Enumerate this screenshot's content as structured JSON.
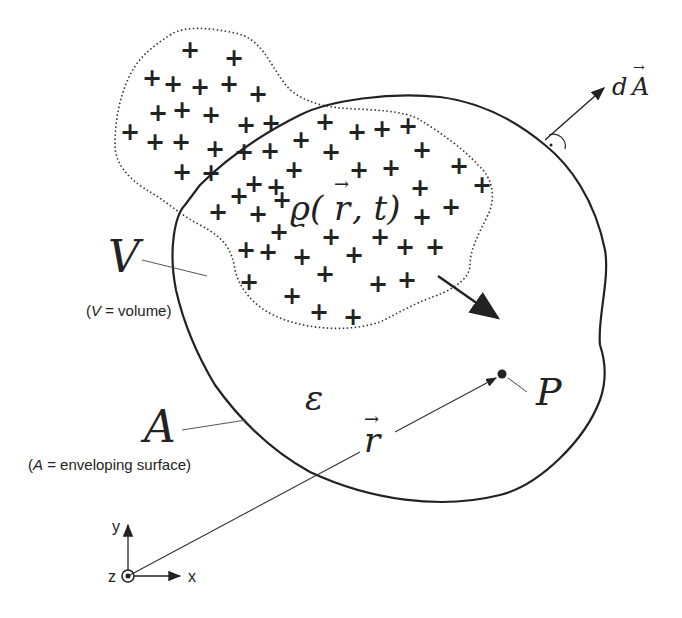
{
  "figure": {
    "density_label": "ϱ(r⃗, t)",
    "density_rho": "ϱ(",
    "density_r": "r",
    "density_tail": ", t)",
    "volume_symbol": "V",
    "volume_caption_prefix": "(",
    "volume_caption_var": "V",
    "volume_caption_rest": " = volume)",
    "surface_symbol": "A",
    "surface_caption_prefix": "(",
    "surface_caption_var": "A",
    "surface_caption_rest": " = enveloping surface)",
    "field_symbol": "ε",
    "position_vector": "r",
    "point_label": "P",
    "area_element_d": "d",
    "area_element_A": "A",
    "vector_arrow": "→",
    "plus_sign": "+",
    "axes": {
      "x": "x",
      "y": "y",
      "z": "z"
    },
    "colors": {
      "ink": "#222222",
      "background": "#ffffff"
    }
  }
}
